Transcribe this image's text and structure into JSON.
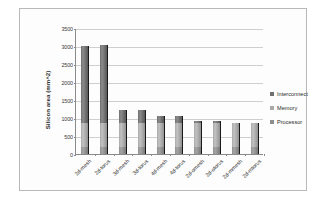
{
  "chart_data": {
    "type": "bar",
    "stacked": true,
    "title": "",
    "xlabel": "",
    "ylabel": "Silicon area (mm^2)",
    "ylim": [
      0,
      3500
    ],
    "ytick_step": 500,
    "ytick_labels": [
      "0",
      "500",
      "1000",
      "1500",
      "2000",
      "2500",
      "3000",
      "3500"
    ],
    "grid": true,
    "legend_position": "right",
    "categories": [
      "2d-mesh",
      "2d-torus",
      "3d-mesh",
      "3d-torus",
      "4d-mesh",
      "4d-torus",
      "2d-omesh",
      "2d-otorus",
      "2d-mmesh",
      "2d-mtorus"
    ],
    "series": [
      {
        "name": "Processor",
        "color": "#8e8e8e",
        "values": [
          200,
          200,
          200,
          200,
          200,
          200,
          200,
          200,
          200,
          200
        ]
      },
      {
        "name": "Memory",
        "color": "#a9a9a9",
        "values": [
          650,
          650,
          650,
          650,
          650,
          650,
          650,
          650,
          650,
          650
        ]
      },
      {
        "name": "Interconnect",
        "color": "#6f6f6f",
        "values": [
          2140,
          2180,
          375,
          370,
          210,
          205,
          80,
          75,
          20,
          15
        ]
      }
    ],
    "totals": [
      2990,
      3030,
      1225,
      1220,
      1060,
      1055,
      930,
      925,
      870,
      865
    ]
  },
  "legend": {
    "items": [
      {
        "label": "Interconnect",
        "color": "#6f6f6f"
      },
      {
        "label": "Memory",
        "color": "#a9a9a9"
      },
      {
        "label": "Processor",
        "color": "#8e8e8e"
      }
    ]
  }
}
